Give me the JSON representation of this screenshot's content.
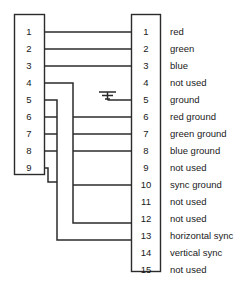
{
  "diagram": {
    "type": "connector-pinout",
    "line_color": "#2b2b2b",
    "text_color": "#1a1a1a",
    "background": "#ffffff"
  },
  "left_connector": {
    "name": "9-pin connector",
    "pin_count": 9,
    "pins": [
      {
        "number": "1"
      },
      {
        "number": "2"
      },
      {
        "number": "3"
      },
      {
        "number": "4"
      },
      {
        "number": "5"
      },
      {
        "number": "6"
      },
      {
        "number": "7"
      },
      {
        "number": "8"
      },
      {
        "number": "9"
      }
    ]
  },
  "right_connector": {
    "name": "15-pin connector",
    "pin_count": 15,
    "pins": [
      {
        "number": "1",
        "label": "red"
      },
      {
        "number": "2",
        "label": "green"
      },
      {
        "number": "3",
        "label": "blue"
      },
      {
        "number": "4",
        "label": "not used"
      },
      {
        "number": "5",
        "label": "ground"
      },
      {
        "number": "6",
        "label": "red ground"
      },
      {
        "number": "7",
        "label": "green ground"
      },
      {
        "number": "8",
        "label": "blue ground"
      },
      {
        "number": "9",
        "label": "not used"
      },
      {
        "number": "10",
        "label": "sync ground"
      },
      {
        "number": "11",
        "label": "not used"
      },
      {
        "number": "12",
        "label": "not used"
      },
      {
        "number": "13",
        "label": "horizontal sync"
      },
      {
        "number": "14",
        "label": "vertical sync"
      },
      {
        "number": "15",
        "label": "not used"
      }
    ]
  },
  "symbols": {
    "ground_symbol": "earth-ground"
  }
}
